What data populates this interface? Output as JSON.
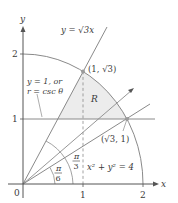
{
  "figure": {
    "colors": {
      "axis": "#555555",
      "curve": "#8a8a8a",
      "line": "#8a8a8a",
      "shade": "#ececec",
      "text": "#3a3a3a",
      "point": "#9a9a9a"
    },
    "axes": {
      "x_label": "x",
      "y_label": "y",
      "origin_label": "0",
      "x_ticks": [
        "1",
        "2"
      ],
      "y_ticks": [
        "1",
        "2"
      ]
    },
    "labels": {
      "line_sqrt3": "y = √3x",
      "point_top": "(1, √3)",
      "point_right": "(√3, 1)",
      "region": "R",
      "line_y1_a": "y = 1, or",
      "line_y1_b": "r = csc θ",
      "circle": "x² + y² = 4",
      "angle_pi6_num": "π",
      "angle_pi6_den": "6",
      "angle_pi3_num": "π",
      "angle_pi3_den": "3"
    },
    "elements": {
      "circle_radius": 2,
      "horizontal_line_y": 1,
      "ray_angles": [
        "π/6",
        "π/3"
      ],
      "points": [
        {
          "x": "1",
          "y": "√3"
        },
        {
          "x": "√3",
          "y": "1"
        }
      ]
    }
  }
}
